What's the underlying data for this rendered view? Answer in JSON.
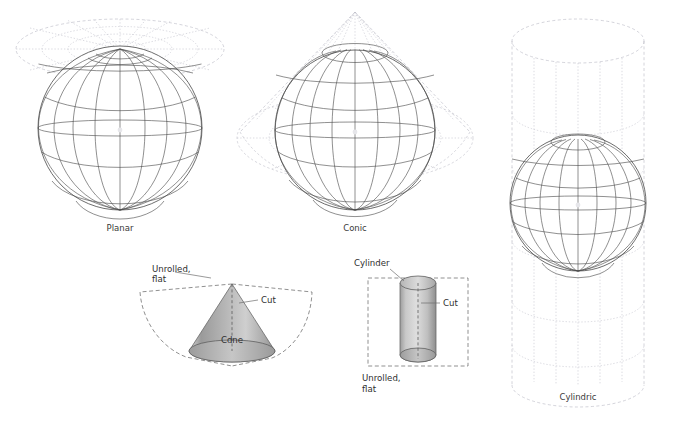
{
  "figure": {
    "background": "#ffffff",
    "line_color": "#3c3c3c",
    "ghost_color": "#b9b9c4",
    "shade_light": "#e2e2e2",
    "shade_mid": "#a8a8a8",
    "shade_dark": "#8c8c8c"
  },
  "panels": {
    "planar": {
      "caption": "Planar",
      "surface": "plane tangent at north pole",
      "globe": {
        "cx": 120,
        "cy": 128,
        "r": 82,
        "parallels": 7,
        "meridians": 12
      }
    },
    "conic": {
      "caption": "Conic",
      "surface": "cone tangent along a parallel",
      "globe": {
        "cx": 355,
        "cy": 130,
        "r": 80,
        "parallels": 7,
        "meridians": 12
      }
    },
    "cylindric": {
      "caption": "Cylindric",
      "surface": "cylinder tangent at the equator",
      "globe": {
        "cx": 578,
        "cy": 203,
        "r": 68,
        "parallels": 7,
        "meridians": 12
      }
    }
  },
  "developable": {
    "cone": {
      "body_label": "Cdne",
      "cut_label": "Cut",
      "unrolled_label_line1": "Unrolled,",
      "unrolled_label_line2": "flat"
    },
    "cylinder": {
      "body_label": "Cylinder",
      "cut_label": "Cut",
      "unrolled_label_line1": "Unrolled,",
      "unrolled_label_line2": "flat"
    }
  }
}
